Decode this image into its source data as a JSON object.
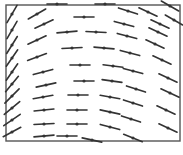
{
  "diagram": {
    "type": "slope_field",
    "frame": {
      "x": 6,
      "y": 5,
      "width": 174,
      "height": 136,
      "stroke": "#555555"
    },
    "segment_color": "#333333",
    "segment_length": 20,
    "segments": [
      {
        "x": 12,
        "y": 14,
        "angle": -60
      },
      {
        "x": 12,
        "y": 30,
        "angle": -60
      },
      {
        "x": 12,
        "y": 45,
        "angle": -58
      },
      {
        "x": 12,
        "y": 58,
        "angle": -55
      },
      {
        "x": 12,
        "y": 72,
        "angle": -55
      },
      {
        "x": 12,
        "y": 84,
        "angle": -50
      },
      {
        "x": 12,
        "y": 96,
        "angle": -45
      },
      {
        "x": 12,
        "y": 108,
        "angle": -40
      },
      {
        "x": 12,
        "y": 120,
        "angle": -35
      },
      {
        "x": 12,
        "y": 132,
        "angle": -28
      },
      {
        "x": 37,
        "y": 14,
        "angle": -30
      },
      {
        "x": 44,
        "y": 24,
        "angle": -25
      },
      {
        "x": 37,
        "y": 40,
        "angle": -25
      },
      {
        "x": 37,
        "y": 57,
        "angle": -20
      },
      {
        "x": 43,
        "y": 72,
        "angle": -15
      },
      {
        "x": 46,
        "y": 85,
        "angle": -12
      },
      {
        "x": 43,
        "y": 97,
        "angle": -10
      },
      {
        "x": 44,
        "y": 110,
        "angle": -6
      },
      {
        "x": 44,
        "y": 124,
        "angle": -3
      },
      {
        "x": 44,
        "y": 136,
        "angle": -5
      },
      {
        "x": 57,
        "y": 4,
        "angle": 0
      },
      {
        "x": 67,
        "y": 32,
        "angle": -5
      },
      {
        "x": 72,
        "y": 48,
        "angle": -3
      },
      {
        "x": 80,
        "y": 65,
        "angle": 0
      },
      {
        "x": 84,
        "y": 81,
        "angle": 0
      },
      {
        "x": 78,
        "y": 95,
        "angle": 0
      },
      {
        "x": 77,
        "y": 110,
        "angle": 0
      },
      {
        "x": 77,
        "y": 124,
        "angle": 0
      },
      {
        "x": 67,
        "y": 136,
        "angle": 0
      },
      {
        "x": 84,
        "y": 17,
        "angle": 0
      },
      {
        "x": 105,
        "y": 4,
        "angle": 0
      },
      {
        "x": 96,
        "y": 32,
        "angle": 3
      },
      {
        "x": 104,
        "y": 48,
        "angle": 5
      },
      {
        "x": 113,
        "y": 66,
        "angle": 7
      },
      {
        "x": 112,
        "y": 81,
        "angle": 8
      },
      {
        "x": 110,
        "y": 97,
        "angle": 10
      },
      {
        "x": 110,
        "y": 112,
        "angle": 12
      },
      {
        "x": 110,
        "y": 127,
        "angle": 15
      },
      {
        "x": 92,
        "y": 140,
        "angle": 12
      },
      {
        "x": 128,
        "y": 11,
        "angle": 18
      },
      {
        "x": 124,
        "y": 24,
        "angle": 15
      },
      {
        "x": 127,
        "y": 36,
        "angle": 15
      },
      {
        "x": 130,
        "y": 53,
        "angle": 15
      },
      {
        "x": 133,
        "y": 71,
        "angle": 15
      },
      {
        "x": 136,
        "y": 89,
        "angle": 18
      },
      {
        "x": 133,
        "y": 103,
        "angle": 18
      },
      {
        "x": 131,
        "y": 119,
        "angle": 18
      },
      {
        "x": 133,
        "y": 138,
        "angle": 22
      },
      {
        "x": 148,
        "y": 12,
        "angle": 25
      },
      {
        "x": 160,
        "y": 24,
        "angle": 25
      },
      {
        "x": 158,
        "y": 32,
        "angle": 25
      },
      {
        "x": 155,
        "y": 44,
        "angle": 25
      },
      {
        "x": 162,
        "y": 60,
        "angle": 25
      },
      {
        "x": 168,
        "y": 78,
        "angle": 25
      },
      {
        "x": 170,
        "y": 93,
        "angle": 25
      },
      {
        "x": 166,
        "y": 110,
        "angle": 25
      },
      {
        "x": 168,
        "y": 128,
        "angle": 25
      },
      {
        "x": 170,
        "y": 6,
        "angle": 30
      },
      {
        "x": 174,
        "y": 20,
        "angle": 30
      }
    ]
  }
}
